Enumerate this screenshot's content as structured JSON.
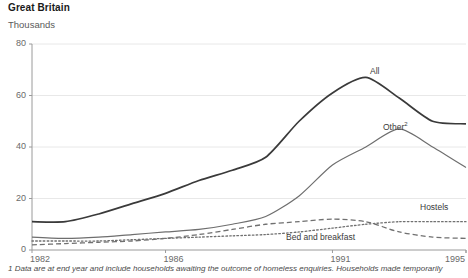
{
  "header": {
    "region_title": "Great Britain",
    "unit_label": "Thousands"
  },
  "footnote": {
    "text": "1 Data are at end year and include households awaiting the outcome of homeless enquiries. Households made temporarily"
  },
  "axes": {
    "y_ticks": [
      "0",
      "20",
      "40",
      "60",
      "80"
    ],
    "x_ticks": [
      "1982",
      "1986",
      "1991",
      "1995"
    ]
  },
  "series_labels": {
    "all": "All",
    "other": "Other",
    "other_superscript": "2",
    "hostels": "Hostels",
    "bed_and_breakfast": "Bed and breakfast"
  },
  "colors": {
    "all_line": "#3a3a3a",
    "other_line": "#6e6e6e",
    "hostels_line": "#707070",
    "bnb_line": "#707070",
    "axis": "#9a9a9a",
    "grid": "#e8e8e8",
    "text": "#4a4a4a"
  },
  "chart_data": {
    "type": "line",
    "title": "Great Britain",
    "subtitle": "Thousands",
    "xlabel": "",
    "ylabel": "Thousands",
    "ylim": [
      0,
      80
    ],
    "xlim": [
      1982,
      1995
    ],
    "grid": true,
    "grid_axis": "y",
    "legend": "inline-labels",
    "x": [
      1982,
      1983,
      1984,
      1985,
      1986,
      1987,
      1988,
      1989,
      1990,
      1991,
      1992,
      1993,
      1994,
      1995
    ],
    "y_ticks": [
      0,
      20,
      40,
      60,
      80
    ],
    "x_ticks_shown": [
      1982,
      1986,
      1991,
      1995
    ],
    "series": [
      {
        "name": "All",
        "style": "solid",
        "color": "#3a3a3a",
        "width": 1.7,
        "values": [
          11,
          11,
          14,
          18,
          22,
          27,
          31,
          36,
          50,
          61,
          67,
          59,
          50,
          49
        ]
      },
      {
        "name": "Other",
        "style": "solid",
        "color": "#6e6e6e",
        "width": 1.2,
        "values": [
          5,
          4.5,
          5,
          6,
          7,
          8,
          10,
          13,
          21,
          33,
          40,
          47,
          40,
          32
        ]
      },
      {
        "name": "Hostels",
        "style": "dotted",
        "color": "#707070",
        "width": 1.3,
        "values": [
          3.5,
          3.5,
          3.5,
          4,
          4.5,
          5,
          5.5,
          6,
          7,
          8.5,
          10,
          11,
          11,
          11
        ]
      },
      {
        "name": "Bed and breakfast",
        "style": "dashed",
        "color": "#707070",
        "width": 1.3,
        "values": [
          2,
          2.5,
          3,
          3.5,
          4.5,
          6,
          8,
          10,
          11,
          12,
          11,
          7,
          5,
          4.5
        ]
      }
    ],
    "annotations": [
      {
        "text": "All",
        "x": 1993.2,
        "y": 68
      },
      {
        "text": "Other2",
        "x": 1994.2,
        "y": 46
      },
      {
        "text": "Hostels",
        "x": 1994.6,
        "y": 16
      },
      {
        "text": "Bed and breakfast",
        "x": 1991.8,
        "y": 5
      }
    ]
  }
}
